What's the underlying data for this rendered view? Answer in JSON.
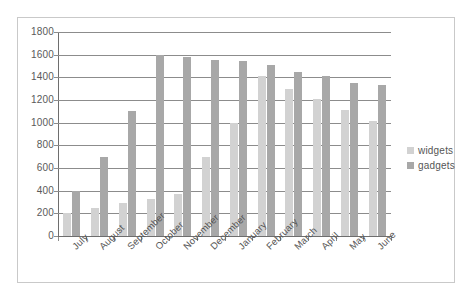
{
  "chart_data": {
    "type": "bar",
    "title": "",
    "xlabel": "",
    "ylabel": "",
    "ylim": [
      0,
      1800
    ],
    "ytick_step": 200,
    "yticks": [
      1800,
      1600,
      1400,
      1200,
      1000,
      800,
      600,
      400,
      200,
      0
    ],
    "ytick_labels": [
      "1800",
      "1600",
      "1400",
      "1200",
      "1000",
      "800",
      "600",
      "400",
      "200",
      "0"
    ],
    "grid": true,
    "legend_position": "right",
    "categories": [
      "July",
      "August",
      "September",
      "October",
      "November",
      "December",
      "January",
      "February",
      "March",
      "April",
      "May",
      "June"
    ],
    "series": [
      {
        "name": "widgets",
        "color": "#d2d2d2",
        "values": [
          200,
          250,
          290,
          325,
          370,
          700,
          1000,
          1410,
          1300,
          1210,
          1110,
          1015
        ]
      },
      {
        "name": "gadgets",
        "color": "#a8a8a8",
        "values": [
          400,
          700,
          1100,
          1600,
          1580,
          1555,
          1540,
          1505,
          1450,
          1410,
          1350,
          1330
        ]
      }
    ]
  },
  "legend": {
    "entries": [
      {
        "label": "widgets",
        "color": "#d2d2d2"
      },
      {
        "label": "gadgets",
        "color": "#a8a8a8"
      }
    ]
  }
}
